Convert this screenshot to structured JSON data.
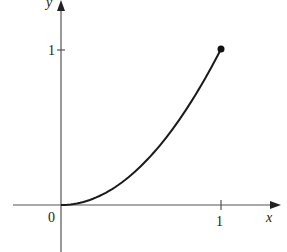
{
  "chart_data": {
    "type": "line",
    "title": "",
    "xlabel": "x",
    "ylabel": "y",
    "function": "y = x^2",
    "x": [
      0,
      0.1,
      0.2,
      0.3,
      0.4,
      0.5,
      0.6,
      0.7,
      0.8,
      0.9,
      1.0
    ],
    "series": [
      {
        "name": "y = x^2",
        "values": [
          0,
          0.01,
          0.04,
          0.09,
          0.16,
          0.25,
          0.36,
          0.49,
          0.64,
          0.81,
          1.0
        ]
      }
    ],
    "endpoint": {
      "x": 1,
      "y": 1,
      "marker": "filled-dot"
    },
    "xticks": [
      "0",
      "1"
    ],
    "yticks": [
      "1"
    ],
    "xlim": [
      -0.3,
      1.4
    ],
    "ylim": [
      -0.3,
      1.3
    ],
    "grid": false,
    "legend": null
  },
  "labels": {
    "origin": "0",
    "x_tick_1": "1",
    "y_tick_1": "1",
    "x_axis": "x",
    "y_axis": "y"
  },
  "colors": {
    "axis": "#555555",
    "curve": "#1a1a1a"
  }
}
